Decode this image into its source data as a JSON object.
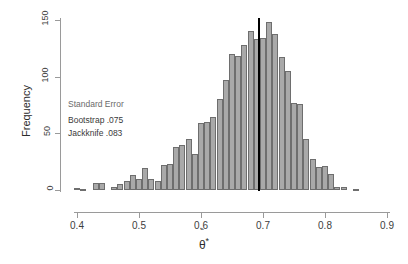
{
  "chart_data": {
    "type": "bar",
    "title": "",
    "subtitle": "",
    "xlabel": "θ̂*",
    "ylabel": "Frequency",
    "xlim": [
      0.39,
      0.9
    ],
    "ylim": [
      0,
      155
    ],
    "grid": false,
    "legend": null,
    "bin_width": 0.01,
    "xticks": [
      "0.4",
      "0.5",
      "0.6",
      "0.7",
      "0.8",
      "0.9"
    ],
    "xtick_values": [
      0.4,
      0.5,
      0.6,
      0.7,
      0.8,
      0.9
    ],
    "yticks": [
      "0",
      "50",
      "100",
      "150"
    ],
    "ytick_values": [
      0,
      50,
      100,
      150
    ],
    "bar_color": "#a9a9a9",
    "bar_edge_color": "#6e6e6e",
    "reference_line": {
      "x": 0.693,
      "color": "#000000",
      "width_px": 2,
      "orientation": "vertical"
    },
    "bins_left": [
      0.395,
      0.405,
      0.415,
      0.425,
      0.435,
      0.445,
      0.455,
      0.465,
      0.475,
      0.485,
      0.495,
      0.505,
      0.515,
      0.525,
      0.535,
      0.545,
      0.555,
      0.565,
      0.575,
      0.585,
      0.595,
      0.605,
      0.615,
      0.625,
      0.635,
      0.645,
      0.655,
      0.665,
      0.675,
      0.685,
      0.695,
      0.705,
      0.715,
      0.725,
      0.735,
      0.745,
      0.755,
      0.765,
      0.775,
      0.785,
      0.795,
      0.805,
      0.815,
      0.825,
      0.835,
      0.845,
      0.855,
      0.865,
      0.875,
      0.885
    ],
    "values": [
      2,
      1,
      0,
      6,
      6,
      0,
      3,
      5,
      8,
      13,
      10,
      19,
      10,
      8,
      22,
      23,
      38,
      40,
      45,
      32,
      59,
      60,
      64,
      80,
      97,
      120,
      118,
      128,
      140,
      133,
      134,
      148,
      138,
      117,
      105,
      77,
      76,
      45,
      27,
      20,
      21,
      14,
      3,
      3,
      0,
      1,
      0,
      0,
      0,
      0
    ],
    "annotations": [
      {
        "text": "Standard Error",
        "role": "annotation-heading"
      },
      {
        "text": "Bootstrap .075",
        "role": "annotation-row"
      },
      {
        "text": "Jackknife .083",
        "role": "annotation-row"
      }
    ]
  },
  "annotation_box": {
    "title": "Standard Error",
    "rows": [
      {
        "label": "Bootstrap",
        "value": ".075",
        "text": "Bootstrap .075"
      },
      {
        "label": "Jackknife",
        "value": ".083",
        "text": "Jackknife .083"
      }
    ]
  },
  "axes": {
    "y_title": "Frequency",
    "x_title_theta": "θ",
    "x_title_hat": "ˆ",
    "x_title_star": "*"
  }
}
